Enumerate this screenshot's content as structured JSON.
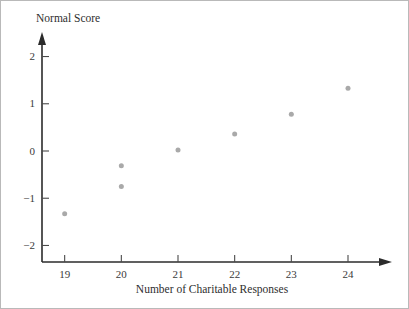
{
  "chart_data": {
    "type": "scatter",
    "title": "",
    "xlabel": "Number of Charitable Responses",
    "ylabel": "Normal Score",
    "xlim": [
      18.6,
      24.6
    ],
    "ylim": [
      -2.35,
      2.35
    ],
    "grid": false,
    "legend": null,
    "x_ticks": [
      19,
      20,
      21,
      22,
      23,
      24
    ],
    "x_tick_labels": [
      "19",
      "20",
      "21",
      "22",
      "23",
      "24"
    ],
    "y_ticks": [
      2,
      1,
      0,
      -1,
      -2
    ],
    "y_tick_labels": [
      "2",
      "1",
      "0",
      "−1",
      "−2"
    ],
    "marker_color": "#a9a9a9",
    "marker_size": 5,
    "axis_color": "#2b2b2b",
    "points": [
      {
        "x": 19,
        "y": -1.33,
        "label": "19, -1.33"
      },
      {
        "x": 20,
        "y": -0.31,
        "label": "20, -0.31"
      },
      {
        "x": 20,
        "y": -0.75,
        "label": "20, -0.75"
      },
      {
        "x": 21,
        "y": 0.02,
        "label": "21, 0.02"
      },
      {
        "x": 22,
        "y": 0.36,
        "label": "22, 0.36"
      },
      {
        "x": 23,
        "y": 0.78,
        "label": "23, 0.78"
      },
      {
        "x": 24,
        "y": 1.33,
        "label": "24, 1.33"
      }
    ]
  },
  "figure": {
    "y_axis_title": "Normal Score",
    "x_axis_title": "Number of Charitable Responses"
  }
}
